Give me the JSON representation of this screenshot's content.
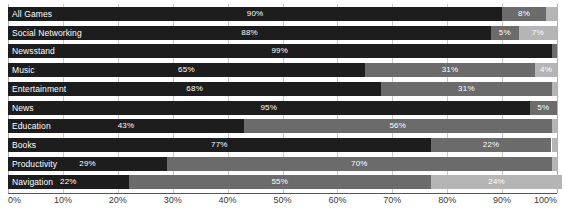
{
  "chart_data": {
    "type": "bar",
    "orientation": "horizontal",
    "stacked": true,
    "title": "",
    "subtitle": "",
    "xlabel": "",
    "ylabel": "",
    "xlim": [
      0,
      100
    ],
    "grid": true,
    "legend": null,
    "xticks": [
      "0%",
      "10%",
      "20%",
      "30%",
      "40%",
      "50%",
      "60%",
      "70%",
      "80%",
      "90%",
      "100%"
    ],
    "xtick_values": [
      0,
      10,
      20,
      30,
      40,
      50,
      60,
      70,
      80,
      90,
      100
    ],
    "categories": [
      "All Games",
      "Social Networking",
      "Newsstand",
      "Music",
      "Entertainment",
      "News",
      "Education",
      "Books",
      "Productivity",
      "Navigation"
    ],
    "series": [
      {
        "name": "segment-1",
        "color": "#1d1d1d",
        "values": [
          90,
          88,
          99,
          65,
          68,
          95,
          43,
          77,
          29,
          22
        ]
      },
      {
        "name": "segment-2",
        "color": "#6b6b6b",
        "values": [
          8,
          5,
          1,
          31,
          31,
          5,
          56,
          22,
          70,
          55
        ]
      },
      {
        "name": "segment-3",
        "color": "#b5b5b5",
        "values": [
          2,
          7,
          0,
          4,
          1,
          0,
          1,
          1,
          1,
          24
        ]
      }
    ],
    "rows": [
      {
        "category": "All Games",
        "segments": [
          {
            "value": 90,
            "label": "90%",
            "show_label": true,
            "tone": "seg-1"
          },
          {
            "value": 8,
            "label": "8%",
            "show_label": true,
            "tone": "seg-2"
          },
          {
            "value": 2,
            "label": "",
            "show_label": false,
            "tone": "seg-3"
          }
        ]
      },
      {
        "category": "Social Networking",
        "segments": [
          {
            "value": 88,
            "label": "88%",
            "show_label": true,
            "tone": "seg-1"
          },
          {
            "value": 5,
            "label": "5%",
            "show_label": true,
            "tone": "seg-2"
          },
          {
            "value": 7,
            "label": "7%",
            "show_label": true,
            "tone": "seg-3"
          }
        ]
      },
      {
        "category": "Newsstand",
        "segments": [
          {
            "value": 99,
            "label": "99%",
            "show_label": true,
            "tone": "seg-1"
          },
          {
            "value": 1,
            "label": "",
            "show_label": false,
            "tone": "seg-2"
          },
          {
            "value": 0,
            "label": "",
            "show_label": false,
            "tone": "seg-3"
          }
        ]
      },
      {
        "category": "Music",
        "segments": [
          {
            "value": 65,
            "label": "65%",
            "show_label": true,
            "tone": "seg-1"
          },
          {
            "value": 31,
            "label": "31%",
            "show_label": true,
            "tone": "seg-2"
          },
          {
            "value": 4,
            "label": "4%",
            "show_label": true,
            "tone": "seg-3"
          }
        ]
      },
      {
        "category": "Entertainment",
        "segments": [
          {
            "value": 68,
            "label": "68%",
            "show_label": true,
            "tone": "seg-1"
          },
          {
            "value": 31,
            "label": "31%",
            "show_label": true,
            "tone": "seg-2"
          },
          {
            "value": 1,
            "label": "",
            "show_label": false,
            "tone": "seg-3"
          }
        ]
      },
      {
        "category": "News",
        "segments": [
          {
            "value": 95,
            "label": "95%",
            "show_label": true,
            "tone": "seg-1"
          },
          {
            "value": 5,
            "label": "5%",
            "show_label": true,
            "tone": "seg-2"
          },
          {
            "value": 0,
            "label": "",
            "show_label": false,
            "tone": "seg-3"
          }
        ]
      },
      {
        "category": "Education",
        "segments": [
          {
            "value": 43,
            "label": "43%",
            "show_label": true,
            "tone": "seg-1"
          },
          {
            "value": 56,
            "label": "56%",
            "show_label": true,
            "tone": "seg-2"
          },
          {
            "value": 1,
            "label": "",
            "show_label": false,
            "tone": "seg-3"
          }
        ]
      },
      {
        "category": "Books",
        "segments": [
          {
            "value": 77,
            "label": "77%",
            "show_label": true,
            "tone": "seg-1"
          },
          {
            "value": 22,
            "label": "22%",
            "show_label": true,
            "tone": "seg-2"
          },
          {
            "value": 1,
            "label": "",
            "show_label": false,
            "tone": "seg-3"
          }
        ]
      },
      {
        "category": "Productivity",
        "segments": [
          {
            "value": 29,
            "label": "29%",
            "show_label": true,
            "tone": "seg-1"
          },
          {
            "value": 70,
            "label": "70%",
            "show_label": true,
            "tone": "seg-2"
          },
          {
            "value": 1,
            "label": "",
            "show_label": false,
            "tone": "seg-3"
          }
        ]
      },
      {
        "category": "Navigation",
        "segments": [
          {
            "value": 22,
            "label": "22%",
            "show_label": true,
            "tone": "seg-1"
          },
          {
            "value": 55,
            "label": "55%",
            "show_label": true,
            "tone": "seg-2"
          },
          {
            "value": 24,
            "label": "24%",
            "show_label": true,
            "tone": "seg-3"
          }
        ]
      }
    ],
    "colors": {
      "segment_1": "#1d1d1d",
      "segment_2": "#6b6b6b",
      "segment_3": "#b5b5b5",
      "grid": "#c9c9c9",
      "axis": "#555555",
      "background": "#ffffff",
      "value_text": "#ffffff",
      "tick_text": "#3a3a3a"
    }
  }
}
